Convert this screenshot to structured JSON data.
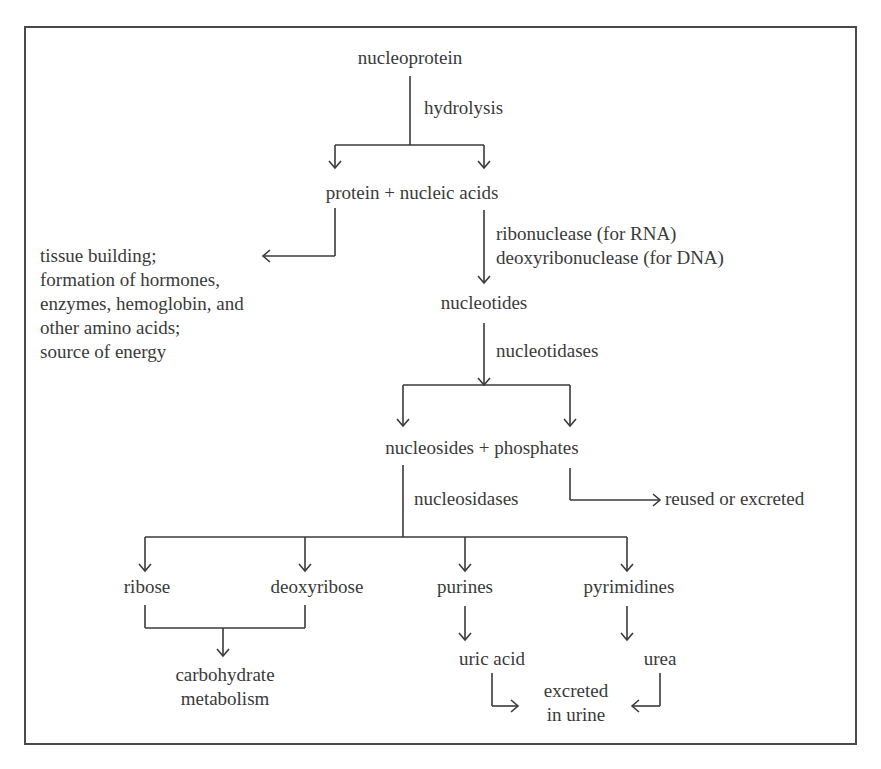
{
  "diagram": {
    "type": "flowchart",
    "nodes": {
      "nucleoprotein": "nucleoprotein",
      "protein_nucleic": "protein + nucleic acids",
      "tissue_uses": [
        "tissue building;",
        "formation of hormones,",
        "enzymes, hemoglobin, and",
        "other amino acids;",
        "source of energy"
      ],
      "nucleotides": "nucleotides",
      "nucleosides_phosphates": "nucleosides + phosphates",
      "reused": "reused or excreted",
      "ribose": "ribose",
      "deoxyribose": "deoxyribose",
      "purines": "purines",
      "pyrimidines": "pyrimidines",
      "carbohydrate_1": "carbohydrate",
      "carbohydrate_2": "metabolism",
      "uric_acid": "uric acid",
      "urea": "urea",
      "excreted_1": "excreted",
      "excreted_2": "in urine"
    },
    "edge_labels": {
      "hydrolysis": "hydrolysis",
      "ribonuclease": "ribonuclease (for RNA)",
      "deoxyribonuclease": "deoxyribonuclease (for DNA)",
      "nucleotidases": "nucleotidases",
      "nucleosidases": "nucleosidases"
    },
    "colors": {
      "line": "#3a3a3a",
      "text": "#3a3a3a",
      "border": "#4a4a4a",
      "background": "#ffffff"
    }
  }
}
